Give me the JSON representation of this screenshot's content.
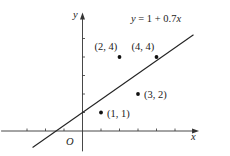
{
  "chart_data": {
    "type": "scatter",
    "title": "",
    "xlabel": "x",
    "ylabel": "y",
    "origin_label": "O",
    "points": [
      {
        "x": 1,
        "y": 1,
        "label": "(1, 1)"
      },
      {
        "x": 2,
        "y": 4,
        "label": "(2, 4)"
      },
      {
        "x": 3,
        "y": 2,
        "label": "(3, 2)"
      },
      {
        "x": 4,
        "y": 4,
        "label": "(4, 4)"
      }
    ],
    "fitted_line": {
      "equation": "y = 1 + 0.7x",
      "intercept": 1,
      "slope": 0.7,
      "x_range": [
        -2.7,
        6.0
      ]
    },
    "xlim": [
      -4.4,
      6.3
    ],
    "ylim": [
      -1.1,
      6.4
    ],
    "x_ticks": [
      -3,
      -2,
      -1,
      1,
      2,
      3,
      4,
      5
    ],
    "y_ticks": [
      1,
      2,
      3,
      4,
      5
    ],
    "grid": false,
    "legend": null
  },
  "layout": {
    "origin_px": [
      82.5,
      131
    ],
    "unit_px": 18.5
  }
}
